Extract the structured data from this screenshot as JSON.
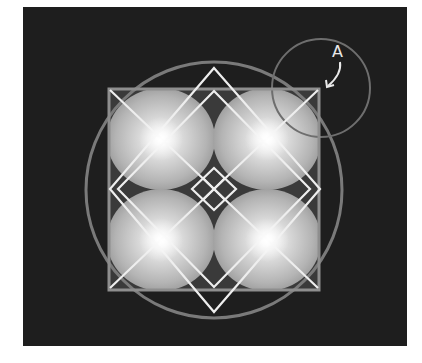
{
  "diagram": {
    "title": "",
    "background": "#ffffff",
    "panel": {
      "x": 23,
      "y": 7,
      "width": 384,
      "height": 339,
      "color": "#1e1e1e"
    },
    "colors": {
      "square_stroke": "#8e8e8e",
      "circle_stroke": "#7a7a7a",
      "line_stroke": "#f0f0f0",
      "sphere_light": "#ffffff",
      "sphere_mid": "#c8c8c8",
      "sphere_dark": "#8a8a8a",
      "label": "#e8e8e8"
    },
    "square": {
      "x": 108,
      "y": 88,
      "width": 212,
      "height": 203
    },
    "big_circle": {
      "cx": 214,
      "cy": 190,
      "r": 128
    },
    "small_circle": {
      "cx": 320,
      "cy": 88,
      "r": 50,
      "label": "A"
    },
    "spheres": [
      {
        "name": "top-left",
        "cx": 161,
        "cy": 139,
        "rx": 53,
        "ry": 50
      },
      {
        "name": "top-right",
        "cx": 267,
        "cy": 139,
        "rx": 53,
        "ry": 50
      },
      {
        "name": "bottom-left",
        "cx": 161,
        "cy": 240,
        "rx": 53,
        "ry": 50
      },
      {
        "name": "bottom-right",
        "cx": 267,
        "cy": 240,
        "rx": 53,
        "ry": 50
      }
    ],
    "annotation": {
      "text": "A",
      "x": 336,
      "y": 55
    }
  }
}
